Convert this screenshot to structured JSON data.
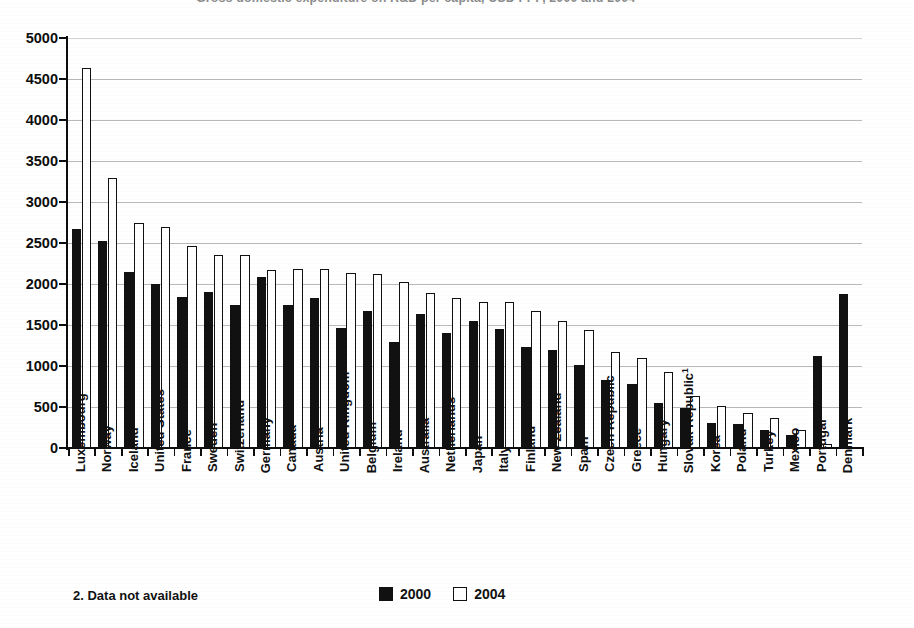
{
  "title": "Gross domestic expenditure on R&D per capita, USD PPP, 2000 and 2004",
  "chart_data": {
    "type": "bar",
    "title": "Gross domestic expenditure on R&D per capita, USD PPP, 2000 and 2004",
    "xlabel": "",
    "ylabel": "",
    "ylim": [
      0,
      5000
    ],
    "ytick_step": 500,
    "grid": true,
    "legend_position": "bottom-center",
    "ytick_labels": [
      "5000",
      "4500",
      "4000",
      "3500",
      "3000",
      "2500",
      "2000",
      "1500",
      "1000",
      "500",
      "0"
    ],
    "categories": [
      "Luxembourg",
      "Norway",
      "Iceland",
      "United States",
      "France",
      "Sweden",
      "Switzerland",
      "Germany",
      "Canada",
      "Austria",
      "United Kingdom",
      "Belgium",
      "Ireland",
      "Australia",
      "Netherlands",
      "Japan",
      "Italy",
      "Finland",
      "New Zealand",
      "Spain",
      "Czech Republic",
      "Greece",
      "Hungary",
      "Slovak Republic",
      "Korea",
      "Poland",
      "Turkey",
      "Mexico",
      "Portugal",
      "Denmark"
    ],
    "category_superscripts": {
      "Germany": "1",
      "Belgium": "1",
      "Australia": "1",
      "Japan": "1",
      "Slovak Republic": "1",
      "Denmark": "2"
    },
    "series": [
      {
        "name": "2000",
        "style": "filled-black",
        "values": [
          2670,
          2530,
          2150,
          1995,
          1840,
          1905,
          1750,
          2085,
          1750,
          1830,
          1465,
          1665,
          1295,
          1630,
          1405,
          1545,
          1450,
          1230,
          1195,
          1015,
          830,
          780,
          555,
          485,
          310,
          290,
          225,
          155,
          1120,
          1880
        ]
      },
      {
        "name": "2004",
        "style": "hollow-white",
        "values": [
          4630,
          3290,
          2740,
          2690,
          2460,
          2355,
          2350,
          2175,
          2180,
          2180,
          2140,
          2120,
          2030,
          1895,
          1835,
          1775,
          1785,
          1670,
          1555,
          1440,
          1170,
          1100,
          930,
          640,
          515,
          425,
          360,
          225,
          45,
          null
        ]
      }
    ]
  },
  "legend": {
    "entries": [
      {
        "label": "2000",
        "swatch": "filled"
      },
      {
        "label": "2004",
        "swatch": "hollow"
      }
    ]
  },
  "footnote": {
    "text": "2. Data not available"
  },
  "colors": {
    "series_2000": "#111111",
    "series_2004": "#ffffff",
    "axis": "#0d0d0d",
    "gridline": "#b9b9b9",
    "background": "#ffffff"
  }
}
